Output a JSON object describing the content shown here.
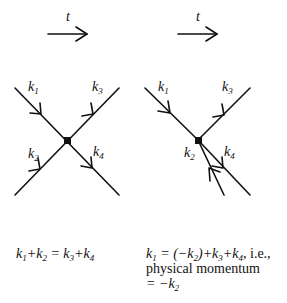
{
  "time_arrows": [
    {
      "label": "t"
    },
    {
      "label": "t"
    }
  ],
  "diagram_left": {
    "labels": {
      "k1": "k",
      "k1_sub": "1",
      "k2": "k",
      "k2_sub": "2",
      "k3": "k",
      "k3_sub": "3",
      "k4": "k",
      "k4_sub": "4"
    },
    "equation": {
      "parts": [
        "k",
        "1",
        "+k",
        "2",
        " = k",
        "3",
        "+k",
        "4"
      ]
    }
  },
  "diagram_right": {
    "labels": {
      "k1": "k",
      "k1_sub": "1",
      "k2": "k",
      "k2_sub": "2",
      "k3": "k",
      "k3_sub": "3",
      "k4": "k",
      "k4_sub": "4"
    },
    "equation": {
      "line1_parts": [
        "k",
        "1",
        " = (−k",
        "2",
        ")+k",
        "3",
        "+k",
        "4",
        ", i.e.,"
      ],
      "line2": "physical momentum",
      "line3_parts": [
        "= −k",
        "2"
      ]
    }
  },
  "colors": {
    "ink": "#111111",
    "background": "#ffffff"
  }
}
